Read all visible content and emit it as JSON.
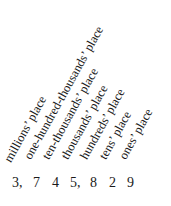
{
  "diagram": {
    "title": "",
    "labels": [
      {
        "text": "millions’ place",
        "left": 13,
        "top": 152
      },
      {
        "text": "one-hundred-thousands’ place",
        "left": 33,
        "top": 149
      },
      {
        "text": "ten-thousands’ place",
        "left": 51,
        "top": 149
      },
      {
        "text": "thousands’ place",
        "left": 70,
        "top": 149
      },
      {
        "text": "hundreds’ place",
        "left": 89,
        "top": 149
      },
      {
        "text": "tens’ place",
        "left": 108,
        "top": 149
      },
      {
        "text": "ones’ place",
        "left": 128,
        "top": 149
      }
    ],
    "digits": [
      {
        "text": "3,",
        "left": 12
      },
      {
        "text": "7",
        "left": 33
      },
      {
        "text": "4",
        "left": 52
      },
      {
        "text": "5,",
        "left": 70
      },
      {
        "text": "8",
        "left": 90
      },
      {
        "text": "2",
        "left": 109
      },
      {
        "text": "9",
        "left": 127
      }
    ],
    "number": "3,745,829"
  }
}
